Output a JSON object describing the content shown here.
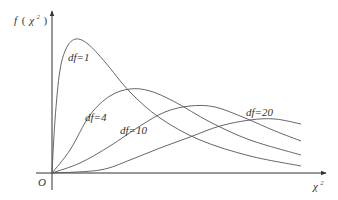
{
  "chart_data": {
    "type": "line",
    "title": "",
    "xlabel": "χ²",
    "ylabel": "f(χ²)",
    "origin_label": "O",
    "grid": false,
    "legend": "inline curve labels",
    "axes": {
      "x_ticks": [],
      "y_ticks": []
    },
    "series": [
      {
        "name": "df=1",
        "label": "df=1",
        "description": "sharp rise from origin, tall peak near left, long decaying tail",
        "points": [
          [
            52,
            173
          ],
          [
            55,
            120
          ],
          [
            60,
            70
          ],
          [
            67,
            47
          ],
          [
            76,
            39
          ],
          [
            88,
            44
          ],
          [
            105,
            62
          ],
          [
            130,
            92
          ],
          [
            160,
            118
          ],
          [
            200,
            140
          ],
          [
            250,
            156
          ],
          [
            301,
            166
          ]
        ]
      },
      {
        "name": "df=4",
        "label": "df=4",
        "description": "peak at moderate height, right-skewed",
        "points": [
          [
            52,
            173
          ],
          [
            70,
            150
          ],
          [
            90,
            115
          ],
          [
            110,
            96
          ],
          [
            130,
            89
          ],
          [
            150,
            91
          ],
          [
            175,
            102
          ],
          [
            210,
            122
          ],
          [
            250,
            140
          ],
          [
            301,
            155
          ]
        ]
      },
      {
        "name": "df=10",
        "label": "df=10",
        "description": "lower broader peak further right",
        "points": [
          [
            52,
            173
          ],
          [
            80,
            163
          ],
          [
            110,
            146
          ],
          [
            140,
            126
          ],
          [
            165,
            112
          ],
          [
            190,
            106
          ],
          [
            215,
            107
          ],
          [
            245,
            118
          ],
          [
            275,
            131
          ],
          [
            301,
            141
          ]
        ]
      },
      {
        "name": "df=20",
        "label": "df=20",
        "description": "lowest, flattest, peak furthest right",
        "points": [
          [
            52,
            173
          ],
          [
            100,
            170
          ],
          [
            130,
            160
          ],
          [
            160,
            148
          ],
          [
            190,
            137
          ],
          [
            220,
            126
          ],
          [
            250,
            120
          ],
          [
            275,
            119
          ],
          [
            301,
            124
          ]
        ]
      }
    ],
    "label_positions": {
      "df=1": [
        70,
        62
      ],
      "df=4": [
        86,
        120
      ],
      "df=10": [
        120,
        133
      ],
      "df=20": [
        246,
        116
      ]
    }
  },
  "labels": {
    "ylabel_f": "f",
    "ylabel_open": "(",
    "ylabel_chi": "χ",
    "ylabel_sup": "2",
    "ylabel_close": ")",
    "xlabel_chi": "χ",
    "xlabel_sup": "2",
    "origin": "O",
    "df1": "df=1",
    "df4": "df=4",
    "df10": "df=10",
    "df20": "df=20"
  }
}
